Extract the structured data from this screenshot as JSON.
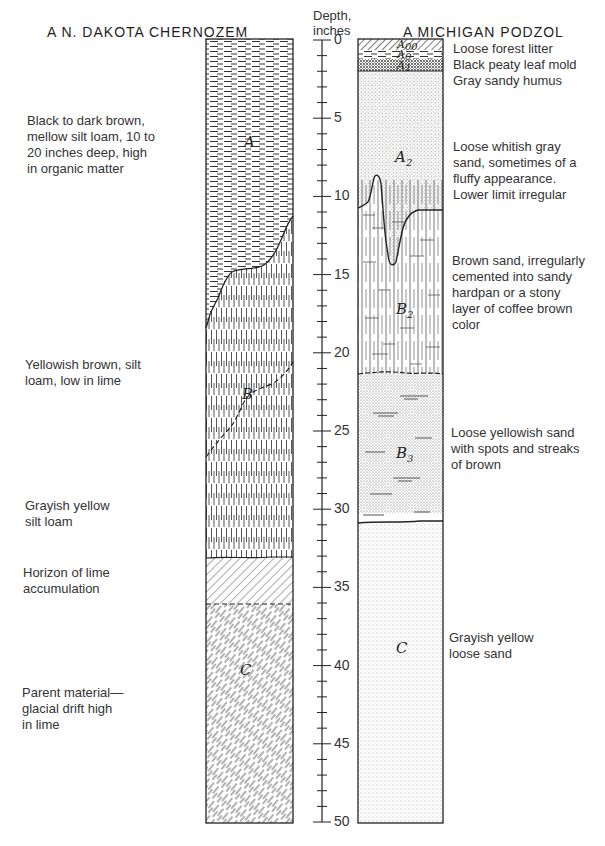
{
  "left_profile": {
    "title": "A N. DAKOTA CHERNOZEM",
    "horizons": [
      {
        "label": "A",
        "sub": "",
        "top_in": 0,
        "bottom_in": "10 to 20 (sloping)",
        "pattern": "horizontal-dashes"
      },
      {
        "label": "B",
        "sub": "",
        "top_in": "10 to 20",
        "bottom_in": 33,
        "pattern": "vertical-dashes"
      },
      {
        "label": "",
        "sub": "",
        "top_in": 33,
        "bottom_in": 36,
        "pattern": "diagonal-hatch"
      },
      {
        "label": "C",
        "sub": "",
        "top_in": 36,
        "bottom_in": 50,
        "pattern": "diagonal-dashes"
      }
    ],
    "descriptions": [
      {
        "lines": [
          "Black to dark brown,",
          "mellow silt loam, 10 to",
          "20 inches deep, high",
          "in organic matter"
        ]
      },
      {
        "lines": [
          "Yellowish brown, silt",
          "loam, low in lime"
        ]
      },
      {
        "lines": [
          "Grayish yellow",
          "silt loam"
        ]
      },
      {
        "lines": [
          "Horizon of lime",
          "accumulation"
        ]
      },
      {
        "lines": [
          "Parent material—",
          "glacial drift high",
          "in lime"
        ]
      }
    ]
  },
  "scale": {
    "title_lines": [
      "Depth,",
      "inches"
    ],
    "min": 0,
    "max": 50,
    "major_step": 5,
    "minor_step": 1,
    "labels": [
      "0",
      "5",
      "10",
      "15",
      "20",
      "25",
      "30",
      "35",
      "40",
      "45",
      "50"
    ]
  },
  "right_profile": {
    "title": "A MICHIGAN PODZOL",
    "horizons": [
      {
        "label": "A",
        "sub": "00",
        "top_in": 0,
        "bottom_in": 0.7,
        "pattern": "diagonal-hatch"
      },
      {
        "label": "A",
        "sub": "0",
        "top_in": 0.7,
        "bottom_in": 1.3,
        "pattern": "horizontal-dashes"
      },
      {
        "label": "A",
        "sub": "1",
        "top_in": 1.3,
        "bottom_in": 2,
        "pattern": "dense-dots"
      },
      {
        "label": "A",
        "sub": "2",
        "top_in": 2,
        "bottom_in": "9.5 (irregular)",
        "pattern": "dots"
      },
      {
        "label": "B",
        "sub": "2",
        "top_in": 9.5,
        "bottom_in": 21.5,
        "pattern": "vertical-lines-cross"
      },
      {
        "label": "B",
        "sub": "3",
        "top_in": 21.5,
        "bottom_in": 30.5,
        "pattern": "dots-streaks"
      },
      {
        "label": "C",
        "sub": "",
        "top_in": 30.5,
        "bottom_in": 50,
        "pattern": "fine-dots"
      }
    ],
    "descriptions": [
      {
        "lines": [
          "Loose forest litter"
        ]
      },
      {
        "lines": [
          "Black peaty leaf mold"
        ]
      },
      {
        "lines": [
          "Gray sandy humus"
        ]
      },
      {
        "lines": [
          "Loose whitish gray",
          "sand, sometimes of a",
          "fluffy appearance.",
          "Lower limit irregular"
        ]
      },
      {
        "lines": [
          "Brown sand, irregularly",
          "cemented into sandy",
          "hardpan or a stony",
          "layer of coffee brown",
          "color"
        ]
      },
      {
        "lines": [
          "Loose yellowish sand",
          "with spots and streaks",
          "of brown"
        ]
      },
      {
        "lines": [
          "Grayish yellow",
          "loose sand"
        ]
      }
    ]
  },
  "colors": {
    "ink": "#2a2a2a",
    "paper": "#ffffff"
  }
}
